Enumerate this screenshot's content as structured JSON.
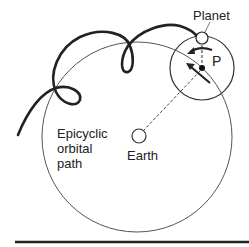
{
  "labels": {
    "planet": "Planet",
    "p": "P",
    "earth": "Earth",
    "path_line1": "Epicyclic",
    "path_line2": "orbital",
    "path_line3": "path"
  },
  "colors": {
    "stroke": "#222222",
    "thin": "#555555",
    "background": "#ffffff"
  }
}
